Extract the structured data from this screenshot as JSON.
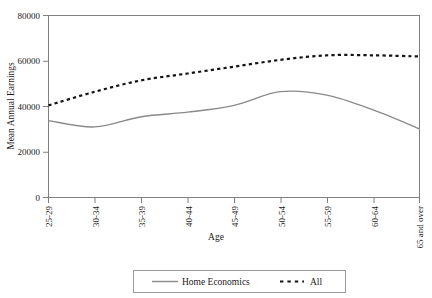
{
  "chart_data": {
    "type": "line",
    "title": "",
    "xlabel": "Age",
    "ylabel": "Mean Annual Earnings",
    "categories": [
      "25-29",
      "30-34",
      "35-39",
      "40-44",
      "45-49",
      "50-54",
      "55-59",
      "60-64",
      "65 and over"
    ],
    "ylim": [
      0,
      80000
    ],
    "yticks": [
      0,
      20000,
      40000,
      60000,
      80000
    ],
    "ytick_labels": [
      "0",
      "20000",
      "40000",
      "60000",
      "80000"
    ],
    "grid": false,
    "legend_position": "bottom",
    "series": [
      {
        "name": "Home Economics",
        "style": "solid",
        "color": "#8a8a8a",
        "values": [
          33800,
          31000,
          35500,
          37500,
          40500,
          46500,
          45000,
          38500,
          30200
        ]
      },
      {
        "name": "All",
        "style": "dotted",
        "color": "#141414",
        "values": [
          40500,
          46500,
          51500,
          54500,
          57500,
          60500,
          62500,
          62500,
          62000
        ]
      }
    ]
  },
  "axes": {
    "y_axis_title": "Mean Annual Earnings",
    "x_axis_title": "Age"
  },
  "legend": {
    "items": [
      {
        "label": "Home Economics",
        "marker": "solid-line-swatch"
      },
      {
        "label": "All",
        "marker": "dotted-line-swatch"
      }
    ]
  }
}
